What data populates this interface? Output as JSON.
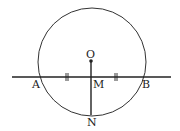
{
  "diagram": {
    "type": "geometry",
    "colors": {
      "stroke": "#222222",
      "background": "#ffffff"
    },
    "circle": {
      "center": "O",
      "cx": 92,
      "cy": 62,
      "r": 54
    },
    "points": [
      {
        "id": "O",
        "label": "O",
        "x": 91,
        "y": 61
      },
      {
        "id": "A",
        "label": "A",
        "x": 38,
        "y": 77
      },
      {
        "id": "B",
        "label": "B",
        "x": 146,
        "y": 77
      },
      {
        "id": "M",
        "label": "M",
        "x": 91,
        "y": 77
      },
      {
        "id": "N",
        "label": "N",
        "x": 91,
        "y": 115
      }
    ],
    "lines": [
      {
        "name": "line-AB",
        "x1": 12,
        "y1": 77,
        "x2": 171,
        "y2": 77
      },
      {
        "name": "segment-ON",
        "x1": 91,
        "y1": 61,
        "x2": 91,
        "y2": 115
      }
    ],
    "equal_marks": [
      {
        "segment": "AM",
        "x": 67,
        "y": 77,
        "style": "double-tick"
      },
      {
        "segment": "MB",
        "x": 116,
        "y": 77,
        "style": "double-tick"
      }
    ],
    "labels": {
      "O": "O",
      "A": "A",
      "B": "B",
      "M": "M",
      "N": "N"
    }
  }
}
